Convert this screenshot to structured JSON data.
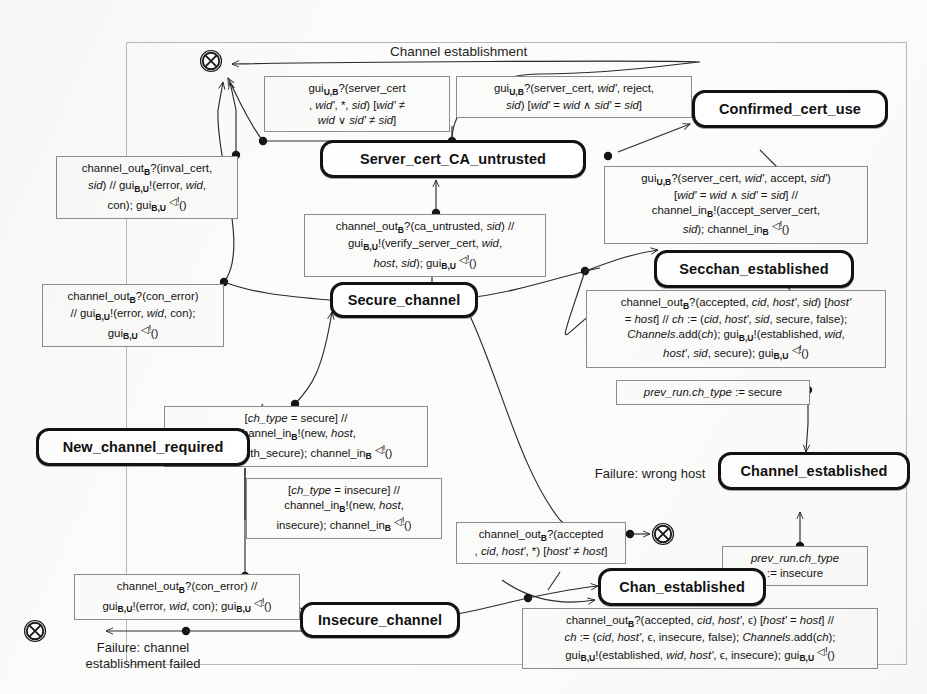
{
  "diagram": {
    "type": "uml-state-machine",
    "frame_title": "Channel establishment",
    "background_color": "#fcfcfb",
    "line_color": "#2a2a2a",
    "state_border_color": "#121212"
  },
  "states": [
    {
      "id": "server_cert_ca_untrusted",
      "label": "Server_cert_CA_untrusted"
    },
    {
      "id": "confirmed_cert_use",
      "label": "Confirmed_cert_use"
    },
    {
      "id": "secchan_established",
      "label": "Secchan_established"
    },
    {
      "id": "secure_channel",
      "label": "Secure_channel"
    },
    {
      "id": "new_channel_required",
      "label": "New_channel_required"
    },
    {
      "id": "channel_established",
      "label": "Channel_established"
    },
    {
      "id": "chan_established",
      "label": "Chan_established"
    },
    {
      "id": "insecure_channel",
      "label": "Insecure_channel"
    }
  ],
  "terminates": [
    {
      "id": "terminate_top",
      "caption": ""
    },
    {
      "id": "terminate_wrong_host",
      "caption": "Failure: wrong host"
    },
    {
      "id": "terminate_failed",
      "caption": "Failure: channel establishment failed"
    }
  ],
  "captions": [
    {
      "id": "failure_wrong_host",
      "text": "Failure: wrong host"
    },
    {
      "id": "failure_channel_establishment_failed",
      "text": "Failure: channel establishment failed"
    }
  ],
  "transition_labels": [
    {
      "id": "t_gui_wrong_wid_sid",
      "lines": [
        "gui<s>U,B</s>?(server_cert",
        ", <i>wid'</i>, *, <i>sid</i>) [<i>wid'</i> ≠",
        "<i>wid</i> ∨ <i>sid'</i> ≠ <i>sid</i>]"
      ]
    },
    {
      "id": "t_gui_reject",
      "lines": [
        "gui<s>U,B</s>?(server_cert, <i>wid'</i>, reject,",
        "<i>sid</i>) [<i>wid'</i> = <i>wid</i> ∧ <i>sid'</i> = <i>sid</i>]"
      ]
    },
    {
      "id": "t_gui_accept",
      "lines": [
        "gui<s>U,B</s>?(server_cert, <i>wid'</i>, accept, <i>sid'</i>)",
        "[<i>wid'</i> = <i>wid</i> ∧ <i>sid'</i> = <i>sid</i>] //",
        "channel_in<s>B</s>!(accept_server_cert,",
        "<i>sid</i>); channel_in<s>B</s> <q>◁!</q>()"
      ]
    },
    {
      "id": "t_inval_cert",
      "lines": [
        "channel_out<s>B</s>?(inval_cert,",
        "<i>sid</i>) // gui<s>B,U</s>!(error, <i>wid</i>,",
        "con); gui<s>B,U</s> <q>◁!</q>()"
      ]
    },
    {
      "id": "t_ca_untrusted",
      "lines": [
        "channel_out<s>B</s>?(ca_untrusted, <i>sid</i>) //",
        "gui<s>B,U</s>!(verify_server_cert, <i>wid</i>,",
        "<i>host</i>, <i>sid</i>); gui<s>B,U</s> <q>◁!</q>()"
      ]
    },
    {
      "id": "t_con_error_secure",
      "lines": [
        "channel_out<s>B</s>?(con_error)",
        "// gui<s>B,U</s>!(error, <i>wid</i>, con);",
        "gui<s>B,U</s> <q>◁!</q>()"
      ]
    },
    {
      "id": "t_accepted_secure",
      "lines": [
        "channel_out<s>B</s>?(accepted, <i>cid</i>, <i>host'</i>, <i>sid</i>) [<i>host'</i>",
        "= <i>host</i>] // <i>ch</i> := (<i>cid</i>, <i>host'</i>, <i>sid</i>, secure, false);",
        "<i>Channels</i>.add(<i>ch</i>); gui<s>B,U</s>!(established, <i>wid</i>,",
        "<i>host'</i>, <i>sid</i>, secure); gui<s>B,U</s> <q>◁!</q>()"
      ]
    },
    {
      "id": "t_prev_run_secure",
      "lines": [
        "<i>prev_run.ch_type</i> := secure"
      ]
    },
    {
      "id": "t_ch_type_secure",
      "lines": [
        "[<i>ch_type</i> = secure] //",
        "channel_in<s>B</s>!(new, <i>host</i>,",
        "server_auth_secure); channel_in<s>B</s> <q>◁!</q>()"
      ]
    },
    {
      "id": "t_ch_type_insecure",
      "lines": [
        "[<i>ch_type</i> = insecure] //",
        "channel_in<s>B</s>!(new, <i>host</i>,",
        "insecure); channel_in<s>B</s> <q>◁!</q>()"
      ]
    },
    {
      "id": "t_accepted_wrong_host",
      "lines": [
        "channel_out<s>B</s>?(accepted",
        ", <i>cid</i>, <i>host'</i>, *) [<i>host'</i> ≠ <i>host</i>]"
      ]
    },
    {
      "id": "t_prev_run_insecure",
      "lines": [
        "<i>prev_run.ch_type</i>",
        ":= insecure"
      ]
    },
    {
      "id": "t_con_error_insecure",
      "lines": [
        "channel_out<s>B</s>?(con_error) //",
        "gui<s>B,U</s>!(error, <i>wid</i>, con); gui<s>B,U</s> <q>◁!</q>()"
      ]
    },
    {
      "id": "t_accepted_insecure",
      "lines": [
        "channel_out<s>B</s>?(accepted, <i>cid</i>, <i>host'</i>, ϵ) [<i>host'</i> = <i>host</i>] //",
        "<i>ch</i> := (<i>cid</i>, <i>host'</i>, ϵ, insecure, false); <i>Channels</i>.add(<i>ch</i>);",
        "gui<s>B,U</s>!(established, <i>wid</i>, <i>host'</i>, ϵ, insecure); gui<s>B,U</s> <q>◁!</q>()"
      ]
    }
  ]
}
